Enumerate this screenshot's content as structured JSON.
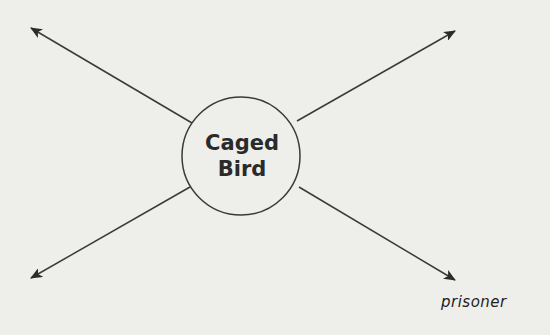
{
  "diagram": {
    "type": "concept-web",
    "center": {
      "line1": "Caged",
      "line2": "Bird"
    },
    "branches": [
      {
        "direction": "upper-left",
        "answer": ""
      },
      {
        "direction": "upper-right",
        "answer": ""
      },
      {
        "direction": "lower-left",
        "answer": ""
      },
      {
        "direction": "lower-right",
        "answer": "prisoner"
      }
    ]
  },
  "colors": {
    "background": "#eeeeea",
    "stroke": "#3a3a3a"
  }
}
